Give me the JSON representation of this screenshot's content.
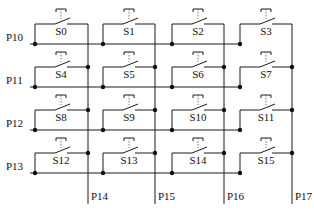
{
  "diagram": {
    "rows": [
      {
        "label": "P10",
        "y": 44
      },
      {
        "label": "P11",
        "y": 87
      },
      {
        "label": "P12",
        "y": 130
      },
      {
        "label": "P13",
        "y": 173
      }
    ],
    "columns": [
      {
        "label": "P14",
        "x": 88
      },
      {
        "label": "P15",
        "x": 155
      },
      {
        "label": "P16",
        "x": 224
      },
      {
        "label": "P17",
        "x": 292
      }
    ],
    "switches": [
      [
        "S0",
        "S1",
        "S2",
        "S3"
      ],
      [
        "S4",
        "S5",
        "S6",
        "S7"
      ],
      [
        "S8",
        "S9",
        "S10",
        "S11"
      ],
      [
        "S12",
        "S13",
        "S14",
        "S15"
      ]
    ],
    "colors": {
      "wire": "#1a1a1a",
      "background": "#ffffff"
    }
  }
}
